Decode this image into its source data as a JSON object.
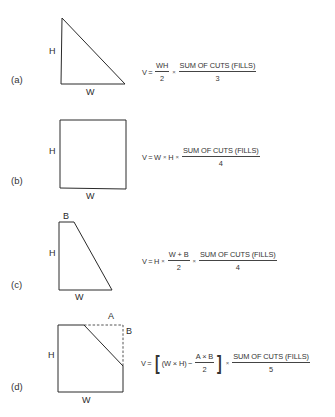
{
  "figure": {
    "parts": [
      {
        "id": "a",
        "label": "(a)",
        "shape": "triangle",
        "dimensions": {
          "height": "H",
          "width": "W"
        },
        "formula": {
          "lhs": "V",
          "eq": "=",
          "term1_num": "WH",
          "term1_den": "2",
          "times": "×",
          "sum_num": "SUM OF CUTS (FILLS)",
          "sum_den": "3"
        }
      },
      {
        "id": "b",
        "label": "(b)",
        "shape": "rectangle",
        "dimensions": {
          "height": "H",
          "width": "W"
        },
        "formula": {
          "lhs": "V",
          "eq": "=",
          "w": "W",
          "times": "×",
          "h": "H",
          "sum_num": "SUM OF CUTS (FILLS)",
          "sum_den": "4"
        }
      },
      {
        "id": "c",
        "label": "(c)",
        "shape": "trapezoid",
        "dimensions": {
          "height": "H",
          "width": "W",
          "top": "B"
        },
        "formula": {
          "lhs": "V",
          "eq": "=",
          "h": "H",
          "times": "×",
          "term_num": "W + B",
          "term_den": "2",
          "sum_num": "SUM OF CUTS (FILLS)",
          "sum_den": "4"
        }
      },
      {
        "id": "d",
        "label": "(d)",
        "shape": "rectangle-with-corner-cut",
        "dimensions": {
          "height": "H",
          "width": "W",
          "cut_horizontal": "A",
          "cut_vertical": "B"
        },
        "formula": {
          "lhs": "V",
          "eq": "=",
          "open_bracket": "[",
          "wh": "(W × H)",
          "minus": "−",
          "term_num": "A × B",
          "term_den": "2",
          "close_bracket": "]",
          "times": "×",
          "sum_num": "SUM OF CUTS (FILLS)",
          "sum_den": "5"
        }
      }
    ]
  },
  "colors": {
    "line": "#2a2a2a",
    "background": "#ffffff"
  }
}
